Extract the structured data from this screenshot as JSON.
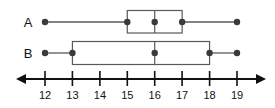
{
  "chart_data": {
    "type": "box",
    "title": "",
    "xlabel": "",
    "ylabel": "",
    "orientation": "horizontal",
    "xlim": [
      11.4,
      19.6
    ],
    "grid": false,
    "legend": "none",
    "axis": {
      "ticks": [
        12,
        13,
        14,
        15,
        16,
        17,
        18,
        19
      ],
      "tick_labels": [
        "12",
        "13",
        "14",
        "15",
        "16",
        "17",
        "18",
        "19"
      ],
      "arrows": [
        "left",
        "right"
      ]
    },
    "series": [
      {
        "name": "A",
        "min": 12,
        "q1": 15,
        "median": 16,
        "q3": 17,
        "max": 19
      },
      {
        "name": "B",
        "min": 12,
        "q1": 13,
        "median": 16,
        "q3": 18,
        "max": 19
      }
    ],
    "colors": {
      "box_stroke": "#595959",
      "marker": "#3a3a3a",
      "axis": "#111111",
      "background": "#ffffff"
    }
  },
  "geometry": {
    "tick_x": [
      45,
      72.4,
      99.9,
      127.3,
      154.7,
      182.1,
      209.6,
      237
    ],
    "rows": [
      {
        "center_y": 22,
        "box_top": 10.5,
        "box_bottom": 33
      },
      {
        "center_y": 53,
        "box_top": 41.5,
        "box_bottom": 64.5
      }
    ],
    "axis_y": 79,
    "tick_top": 71,
    "tick_bottom": 86,
    "tick_label_y": 99,
    "label_x": 28,
    "arrow_left_x": 16,
    "arrow_right_x": 266,
    "dot_radius": 3.2
  }
}
